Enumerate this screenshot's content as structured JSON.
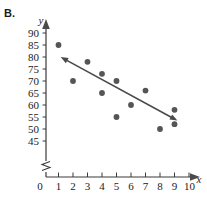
{
  "figure": {
    "panel_label": "B.",
    "background_color": "#ffffff",
    "point_color": "#555555",
    "line_color": "#4a4a4a",
    "axis_color": "#3a3a3a"
  },
  "chart_data": {
    "type": "scatter",
    "title": "",
    "xlabel": "x",
    "ylabel": "y",
    "xlim": [
      0,
      10
    ],
    "ylim": [
      45,
      90
    ],
    "y_axis_break": true,
    "y_break_from": 0,
    "y_break_to": 45,
    "grid": false,
    "legend": null,
    "x_ticks": [
      0,
      1,
      2,
      3,
      4,
      5,
      6,
      7,
      8,
      9,
      10
    ],
    "x_tick_labels": [
      "0",
      "1",
      "2",
      "3",
      "4",
      "5",
      "6",
      "7",
      "8",
      "9",
      "10"
    ],
    "y_ticks": [
      45,
      50,
      55,
      60,
      65,
      70,
      75,
      80,
      85,
      90
    ],
    "y_tick_labels": [
      "45",
      "50",
      "55",
      "60",
      "65",
      "70",
      "75",
      "80",
      "85",
      "90"
    ],
    "y_origin_label": "0",
    "points": [
      {
        "x": 1,
        "y": 85
      },
      {
        "x": 2,
        "y": 70
      },
      {
        "x": 3,
        "y": 78
      },
      {
        "x": 4,
        "y": 73
      },
      {
        "x": 4,
        "y": 65
      },
      {
        "x": 5,
        "y": 70
      },
      {
        "x": 5,
        "y": 55
      },
      {
        "x": 6,
        "y": 60
      },
      {
        "x": 7,
        "y": 66
      },
      {
        "x": 8,
        "y": 50
      },
      {
        "x": 9,
        "y": 58
      },
      {
        "x": 9,
        "y": 52
      }
    ],
    "annotations": [
      {
        "type": "double-arrow-trend-line",
        "x1": 1.15,
        "y1": 80.0,
        "x2": 9.2,
        "y2": 53.5,
        "arrow_start": true,
        "arrow_end": true
      }
    ]
  }
}
